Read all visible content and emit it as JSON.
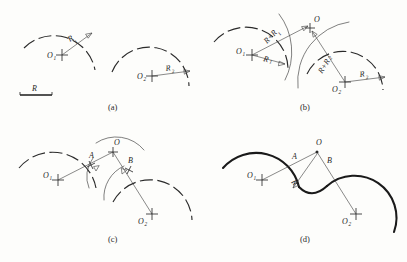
{
  "figure": {
    "background_color": "#fdfdfb",
    "line_color": "#2a2a2a",
    "bold_curve_color": "#1a1a1a"
  },
  "scale_bar": {
    "label": "R",
    "description": "given radius length"
  },
  "panels": [
    {
      "id": "a",
      "caption": "(a)",
      "description": "Two given arcs with their centers and radii",
      "labels": {
        "center_1": "O",
        "center_1_sub": "1",
        "radius_1": "R",
        "radius_1_sub": "1",
        "center_2": "O",
        "center_2_sub": "2",
        "radius_2": "R",
        "radius_2_sub": "2"
      }
    },
    {
      "id": "b",
      "caption": "(b)",
      "description": "Construction arcs of radius R+R1 from O1 and R+R2 from O2 intersect at O",
      "labels": {
        "center_1": "O",
        "center_1_sub": "1",
        "radius_1": "R",
        "radius_1_sub": "1",
        "center_2": "O",
        "center_2_sub": "2",
        "radius_2": "R",
        "radius_2_sub": "2",
        "sum_1": "R+R",
        "sum_1_sub": "1",
        "sum_2": "R+R",
        "sum_2_sub": "2",
        "intersection": "O"
      }
    },
    {
      "id": "c",
      "caption": "(c)",
      "description": "Tangent points A and B located on lines O1-O and O-O2",
      "labels": {
        "center_1": "O",
        "center_1_sub": "1",
        "center_2": "O",
        "center_2_sub": "2",
        "intersection": "O",
        "tangent_a": "A",
        "tangent_b": "B"
      }
    },
    {
      "id": "d",
      "caption": "(d)",
      "description": "Finished reverse curve drawn with radius R through tangent points A and B",
      "labels": {
        "center_1": "O",
        "center_1_sub": "1",
        "center_2": "O",
        "center_2_sub": "2",
        "intersection": "O",
        "tangent_a": "A",
        "tangent_b": "B",
        "radius": "R"
      }
    }
  ]
}
